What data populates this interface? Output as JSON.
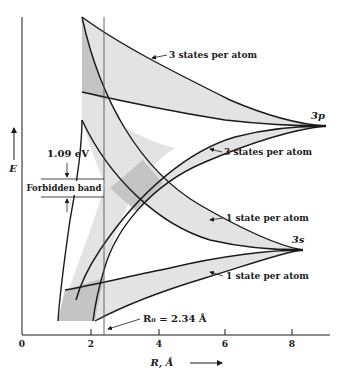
{
  "diagram": {
    "y_axis": {
      "label": "E"
    },
    "x_axis": {
      "label": "R, Å",
      "ticks": [
        "0",
        "2",
        "4",
        "6",
        "8"
      ]
    },
    "levels": {
      "upper": "3p",
      "lower": "3s"
    },
    "band_labels": {
      "p_upper": "3 states per atom",
      "p_lower": "3 states per atom",
      "s_upper": "1 state per atom",
      "s_lower": "1 state per atom"
    },
    "gap": {
      "value": "1.09 eV",
      "label": "Forbidden band"
    },
    "equilibrium": {
      "label": "R₀ = 2.34 Å"
    },
    "colors": {
      "band_fill": "#e3e3e3",
      "overlap_fill": "#c4c4c4",
      "line": "#1a1a1a"
    }
  }
}
